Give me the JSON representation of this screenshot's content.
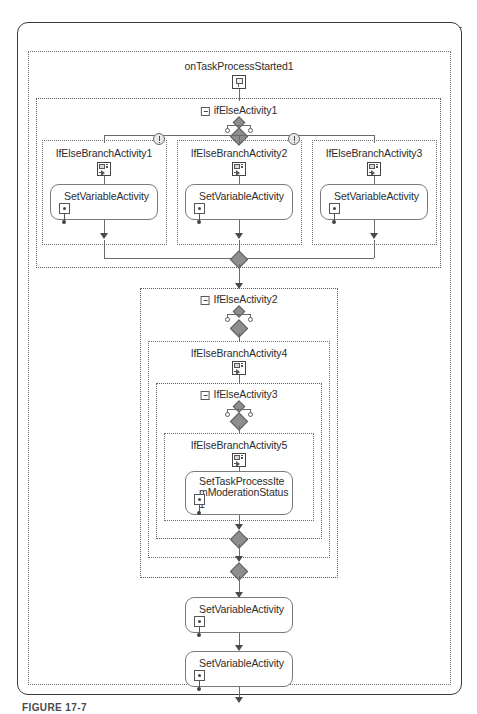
{
  "diagram": {
    "type": "workflow-designer-canvas",
    "caption": "FIGURE 17-7"
  },
  "root": {
    "name": "workflow-root-frame",
    "entry_arrow": "entry-connector-from-right"
  },
  "nodes": {
    "on_task_process_started": {
      "label": "onTaskProcessStarted1",
      "icon": "event-handler-icon"
    },
    "if_else_1": {
      "label": "ifElseActivity1",
      "collapse_icon": "collapse-toggle-icon",
      "condition_icon": "condition-branch-icon"
    },
    "if_else_2": {
      "label": "IfElseActivity2",
      "collapse_icon": "collapse-toggle-icon",
      "condition_icon": "condition-branch-icon"
    },
    "if_else_3": {
      "label": "IfElseActivity3",
      "collapse_icon": "collapse-toggle-icon",
      "condition_icon": "condition-branch-icon"
    },
    "branches": [
      {
        "label": "IfElseBranchActivity1",
        "icon": "branch-icon",
        "warning": true
      },
      {
        "label": "IfElseBranchActivity2",
        "icon": "branch-icon",
        "warning": true
      },
      {
        "label": "IfElseBranchActivity3",
        "icon": "branch-icon",
        "warning": false
      },
      {
        "label": "IfElseBranchActivity4",
        "icon": "branch-icon",
        "warning": false
      },
      {
        "label": "IfElseBranchActivity5",
        "icon": "branch-icon",
        "warning": false
      }
    ],
    "activities": [
      {
        "label": "SetVariableActivity\n1",
        "icon": "set-variable-icon"
      },
      {
        "label": "SetVariableActivity\n2",
        "icon": "set-variable-icon"
      },
      {
        "label": "SetVariableActivity\n3",
        "icon": "set-variable-icon"
      },
      {
        "label": "SetTaskProcessIte\nmModerationStatus\n1",
        "icon": "set-variable-icon"
      },
      {
        "label": "SetVariableActivity\n4",
        "icon": "set-variable-icon"
      },
      {
        "label": "SetVariableActivity\n5",
        "icon": "set-variable-icon"
      }
    ]
  },
  "colors": {
    "frame_border": "#3a3a3a",
    "dotted_border": "#6e6e6e",
    "connector": "#6a6a6a",
    "diamond_fill": "#8e8e8e",
    "box_border": "#7a7a7a",
    "text": "#2d2d2d",
    "canvas_background": "#ffffff"
  }
}
